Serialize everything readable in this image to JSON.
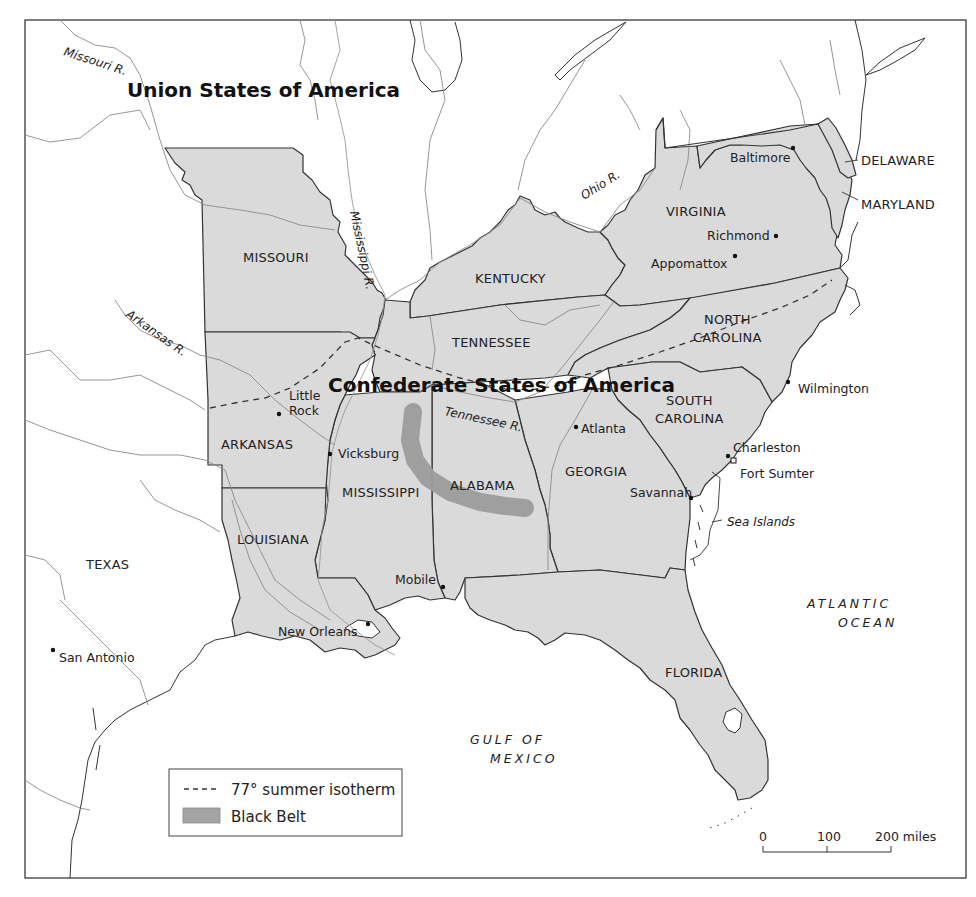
{
  "map": {
    "title_union": "Union States of America",
    "title_confederate": "Confederate States of America"
  },
  "states": [
    {
      "id": "missouri",
      "label": "MISSOURI"
    },
    {
      "id": "kentucky",
      "label": "KENTUCKY"
    },
    {
      "id": "virginia",
      "label": "VIRGINIA"
    },
    {
      "id": "tennessee",
      "label": "TENNESSEE"
    },
    {
      "id": "north-carolina",
      "label_line1": "NORTH",
      "label_line2": "CAROLINA"
    },
    {
      "id": "south-carolina",
      "label_line1": "SOUTH",
      "label_line2": "CAROLINA"
    },
    {
      "id": "arkansas",
      "label": "ARKANSAS"
    },
    {
      "id": "mississippi",
      "label": "MISSISSIPPI"
    },
    {
      "id": "alabama",
      "label": "ALABAMA"
    },
    {
      "id": "georgia",
      "label": "GEORGIA"
    },
    {
      "id": "louisiana",
      "label": "LOUISIANA"
    },
    {
      "id": "texas",
      "label": "TEXAS"
    },
    {
      "id": "florida",
      "label": "FLORIDA"
    },
    {
      "id": "delaware",
      "label": "DELAWARE"
    },
    {
      "id": "maryland",
      "label": "MARYLAND"
    }
  ],
  "cities": [
    {
      "id": "baltimore",
      "label": "Baltimore"
    },
    {
      "id": "richmond",
      "label": "Richmond"
    },
    {
      "id": "appomattox",
      "label": "Appomattox"
    },
    {
      "id": "wilmington",
      "label": "Wilmington"
    },
    {
      "id": "little-rock",
      "label_line1": "Little",
      "label_line2": "Rock"
    },
    {
      "id": "vicksburg",
      "label": "Vicksburg"
    },
    {
      "id": "atlanta",
      "label": "Atlanta"
    },
    {
      "id": "charleston",
      "label": "Charleston"
    },
    {
      "id": "fort-sumter",
      "label": "Fort Sumter"
    },
    {
      "id": "savannah",
      "label": "Savannah"
    },
    {
      "id": "mobile",
      "label": "Mobile"
    },
    {
      "id": "new-orleans",
      "label": "New Orleans"
    },
    {
      "id": "san-antonio",
      "label": "San Antonio"
    }
  ],
  "rivers": [
    {
      "id": "missouri-river",
      "label": "Missouri R."
    },
    {
      "id": "mississippi-river",
      "label": "Mississippi R."
    },
    {
      "id": "ohio-river",
      "label": "Ohio R."
    },
    {
      "id": "arkansas-river",
      "label": "Arkansas R."
    },
    {
      "id": "tennessee-river",
      "label": "Tennessee R."
    }
  ],
  "features": {
    "sea_islands": "Sea Islands",
    "atlantic_line1": "ATLANTIC",
    "atlantic_line2": "OCEAN",
    "gulf_line1": "GULF OF",
    "gulf_line2": "MEXICO"
  },
  "legend": {
    "isotherm_label": "77° summer isotherm",
    "black_belt_label": "Black Belt"
  },
  "scale_bar": {
    "tick_0": "0",
    "tick_100": "100",
    "tick_200": "200 miles"
  },
  "colors": {
    "confederate_fill": "#dadada",
    "black_belt": "#9c9c9c",
    "border": "#333333"
  }
}
